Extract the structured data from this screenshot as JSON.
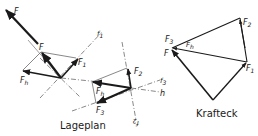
{
  "diagram": {
    "lageplan": {
      "caption": "Lageplan",
      "labels": {
        "F_top": "F",
        "F_mid": "F",
        "F1": "F",
        "F1_sub": "1",
        "Fh_left": "F",
        "Fh_left_sub": "h",
        "line_f1": "f",
        "line_f1_sub": "1",
        "F2": "F",
        "F2_sub": "2",
        "Fh_right": "F",
        "Fh_right_sub": "h",
        "F3": "F",
        "F3_sub": "3",
        "line_f3": "f",
        "line_f3_sub": "3",
        "line_h": "h",
        "line_f2": "f",
        "line_f2_sub": "2"
      }
    },
    "krafteck": {
      "caption": "Krafteck",
      "labels": {
        "F3": "F",
        "F3_sub": "3",
        "F": "F",
        "Fh": "F",
        "Fh_sub": "h",
        "F2": "F",
        "F2_sub": "2",
        "F1": "F",
        "F1_sub": "1"
      }
    },
    "colors": {
      "ink": "#1a1a1a",
      "thin": "#555555",
      "background": "#ffffff"
    }
  }
}
